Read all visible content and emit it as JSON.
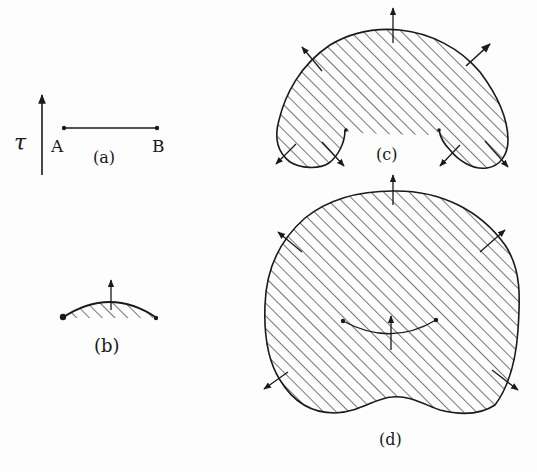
{
  "figure": {
    "panels": [
      {
        "id": "a",
        "caption": "(a)",
        "labels": {
          "tau": "τ",
          "left": "A",
          "right": "B"
        }
      },
      {
        "id": "b",
        "caption": "(b)"
      },
      {
        "id": "c",
        "caption": "(c)"
      },
      {
        "id": "d",
        "caption": "(d)"
      }
    ],
    "colors": {
      "ink": "#1a1a1a",
      "background": "#fdfdfd"
    }
  }
}
